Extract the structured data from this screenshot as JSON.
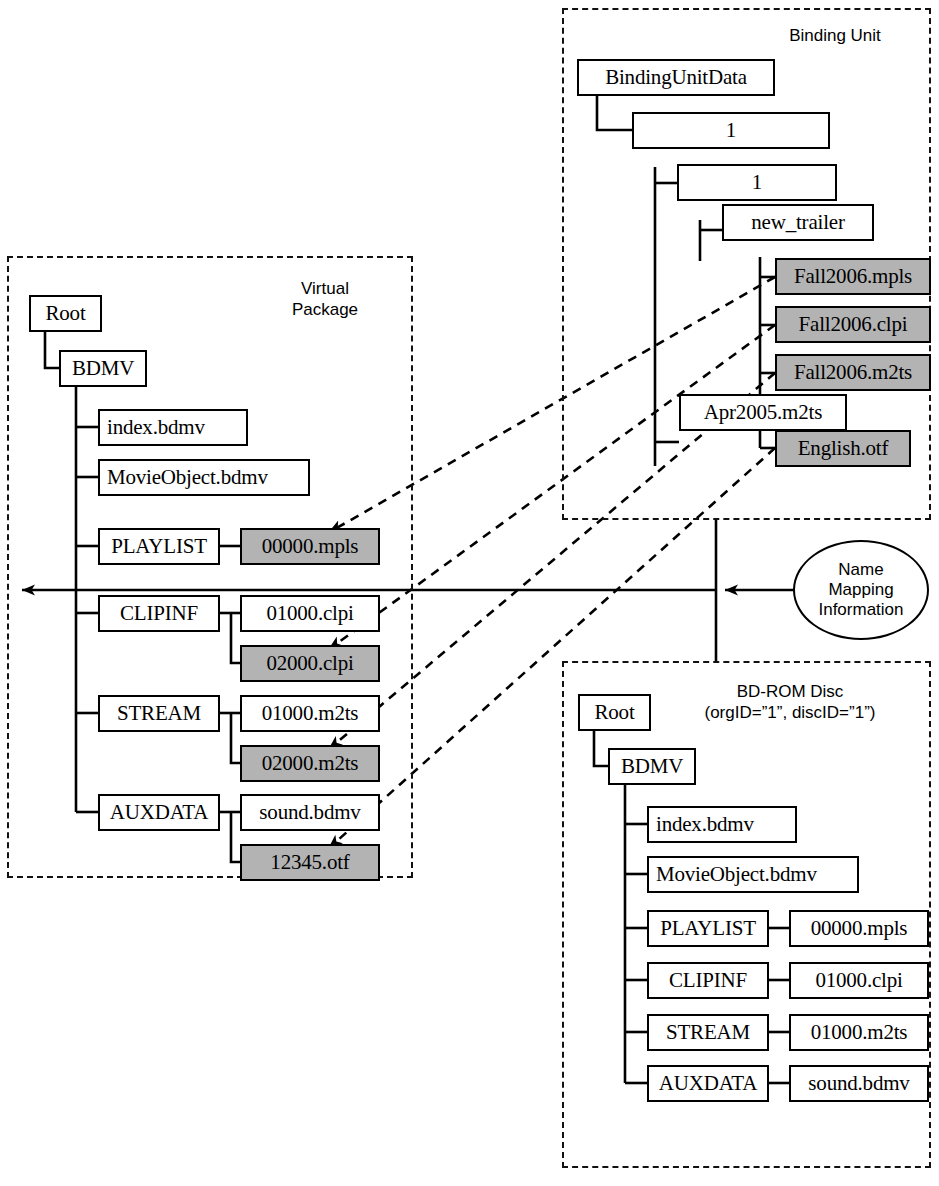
{
  "diagram": {
    "shaded_color": "#b3b3b3",
    "line_color": "#000000"
  },
  "groups": {
    "virtual_package": {
      "title": "Virtual\nPackage",
      "nodes": {
        "root": "Root",
        "bdmv": "BDMV",
        "index": "index.bdmv",
        "movieobject": "MovieObject.bdmv",
        "playlist_dir": "PLAYLIST",
        "playlist_file_1": "00000.mpls",
        "clipinf_dir": "CLIPINF",
        "clipinf_file_1": "01000.clpi",
        "clipinf_file_2": "02000.clpi",
        "stream_dir": "STREAM",
        "stream_file_1": "01000.m2ts",
        "stream_file_2": "02000.m2ts",
        "auxdata_dir": "AUXDATA",
        "auxdata_file_1": "sound.bdmv",
        "auxdata_file_2": "12345.otf"
      }
    },
    "binding_unit": {
      "title": "Binding Unit",
      "nodes": {
        "bindingunitdata": "BindingUnitData",
        "org_id": "1",
        "disc_id": "1",
        "new_trailer": "new_trailer",
        "fall2006_mpls": "Fall2006.mpls",
        "fall2006_clpi": "Fall2006.clpi",
        "fall2006_m2ts": "Fall2006.m2ts",
        "apr2005_m2ts": "Apr2005.m2ts",
        "english_otf": "English.otf"
      }
    },
    "bd_rom_disc": {
      "title": "BD-ROM Disc\n(orgID=”1”, discID=”1”)",
      "nodes": {
        "root": "Root",
        "bdmv": "BDMV",
        "index": "index.bdmv",
        "movieobject": "MovieObject.bdmv",
        "playlist_dir": "PLAYLIST",
        "playlist_file_1": "00000.mpls",
        "clipinf_dir": "CLIPINF",
        "clipinf_file_1": "01000.clpi",
        "stream_dir": "STREAM",
        "stream_file_1": "01000.m2ts",
        "auxdata_dir": "AUXDATA",
        "auxdata_file_1": "sound.bdmv"
      }
    }
  },
  "annotations": {
    "name_mapping": "Name\nMapping\nInformation"
  }
}
